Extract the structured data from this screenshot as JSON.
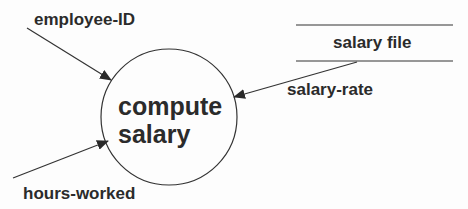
{
  "diagram": {
    "type": "data-flow-diagram",
    "process": {
      "label_line1": "compute",
      "label_line2": "salary"
    },
    "data_store": {
      "label": "salary file"
    },
    "flows": [
      {
        "label": "employee-ID",
        "direction": "in"
      },
      {
        "label": "salary-rate",
        "direction": "in",
        "source": "salary file"
      },
      {
        "label": "hours-worked",
        "direction": "in"
      }
    ],
    "colors": {
      "line": "#333333",
      "text": "#2b2b2b",
      "background": "#fdfdfd"
    }
  }
}
